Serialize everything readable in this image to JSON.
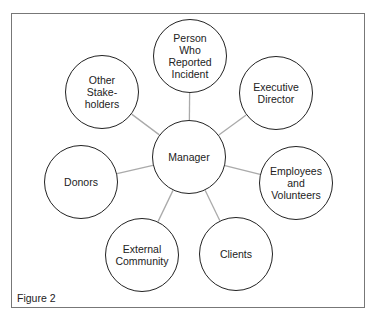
{
  "diagram": {
    "center": {
      "id": "manager",
      "label": "Manager",
      "cx": 189,
      "cy": 157
    },
    "nodes": [
      {
        "id": "person-who-reported",
        "label": "Person\nWho\nReported\nIncident",
        "cx": 190,
        "cy": 56
      },
      {
        "id": "executive-director",
        "label": "Executive\nDirector",
        "cx": 276,
        "cy": 93
      },
      {
        "id": "employees-volunteers",
        "label": "Employees\nand\nVolunteers",
        "cx": 296,
        "cy": 183
      },
      {
        "id": "clients",
        "label": "Clients",
        "cx": 236,
        "cy": 254
      },
      {
        "id": "external-community",
        "label": "External\nCommunity",
        "cx": 142,
        "cy": 255
      },
      {
        "id": "donors",
        "label": "Donors",
        "cx": 81,
        "cy": 182
      },
      {
        "id": "other-stakeholders",
        "label": "Other\nStake-\nholders",
        "cx": 102,
        "cy": 92
      }
    ],
    "edge_color": "#aaaaaa",
    "node_border_color": "#222222"
  },
  "caption": "Figure 2"
}
